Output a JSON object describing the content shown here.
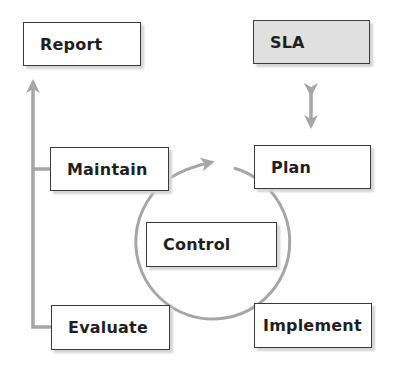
{
  "diagram": {
    "nodes": {
      "report": {
        "label": "Report"
      },
      "sla": {
        "label": "SLA"
      },
      "maintain": {
        "label": "Maintain"
      },
      "plan": {
        "label": "Plan"
      },
      "control": {
        "label": "Control"
      },
      "evaluate": {
        "label": "Evaluate"
      },
      "implement": {
        "label": "Implement"
      }
    },
    "colors": {
      "connector": "#a6a6a6",
      "box_border": "#3a3a3a",
      "box_fill": "#ffffff",
      "sla_fill": "#e0e0e0",
      "text": "#1f1f1f"
    }
  }
}
